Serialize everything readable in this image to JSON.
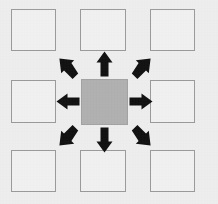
{
  "figure": {
    "title": "",
    "background_color": "#ededed",
    "width": 218,
    "height": 204
  },
  "diagram": {
    "type": "radial-grid-propagation",
    "grid": {
      "rows": 3,
      "columns": 3
    },
    "center_cell": {
      "label": "",
      "role": "source",
      "fill_color": "#b0b0b0",
      "border_color": "#a2a2a2",
      "x": 81,
      "y": 79,
      "width": 47,
      "height": 46
    },
    "neighbor_cells": [
      {
        "label": "",
        "role": "neighbor",
        "position": "top-left",
        "fill_color": "#f0f0f0",
        "border_color": "#9a9a9a",
        "x": 11,
        "y": 9,
        "width": 45,
        "height": 42
      },
      {
        "label": "",
        "role": "neighbor",
        "position": "top-center",
        "fill_color": "#f0f0f0",
        "border_color": "#9a9a9a",
        "x": 80,
        "y": 9,
        "width": 46,
        "height": 42
      },
      {
        "label": "",
        "role": "neighbor",
        "position": "top-right",
        "fill_color": "#f0f0f0",
        "border_color": "#9a9a9a",
        "x": 150,
        "y": 9,
        "width": 45,
        "height": 42
      },
      {
        "label": "",
        "role": "neighbor",
        "position": "middle-left",
        "fill_color": "#f0f0f0",
        "border_color": "#9a9a9a",
        "x": 11,
        "y": 80,
        "width": 45,
        "height": 43
      },
      {
        "label": "",
        "role": "neighbor",
        "position": "middle-right",
        "fill_color": "#f0f0f0",
        "border_color": "#9a9a9a",
        "x": 150,
        "y": 80,
        "width": 45,
        "height": 43
      },
      {
        "label": "",
        "role": "neighbor",
        "position": "bottom-left",
        "fill_color": "#f0f0f0",
        "border_color": "#9a9a9a",
        "x": 11,
        "y": 150,
        "width": 45,
        "height": 42
      },
      {
        "label": "",
        "role": "neighbor",
        "position": "bottom-center",
        "fill_color": "#f0f0f0",
        "border_color": "#9a9a9a",
        "x": 80,
        "y": 150,
        "width": 46,
        "height": 42
      },
      {
        "label": "",
        "role": "neighbor",
        "position": "bottom-right",
        "fill_color": "#f0f0f0",
        "border_color": "#9a9a9a",
        "x": 150,
        "y": 150,
        "width": 45,
        "height": 42
      }
    ],
    "arrows": {
      "color": "#111111",
      "count": 8,
      "direction": "outward-from-center",
      "items": [
        {
          "direction": "north-west",
          "label": ""
        },
        {
          "direction": "north",
          "label": ""
        },
        {
          "direction": "north-east",
          "label": ""
        },
        {
          "direction": "west",
          "label": ""
        },
        {
          "direction": "east",
          "label": ""
        },
        {
          "direction": "south-west",
          "label": ""
        },
        {
          "direction": "south",
          "label": ""
        },
        {
          "direction": "south-east",
          "label": ""
        }
      ]
    }
  }
}
